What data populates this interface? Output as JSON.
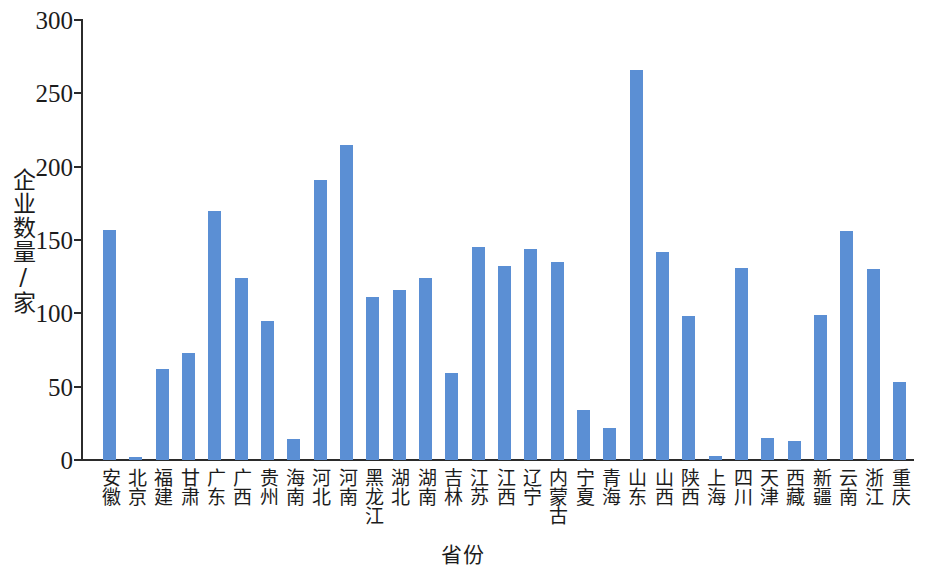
{
  "chart_data": {
    "type": "bar",
    "title": "",
    "xlabel": "省份",
    "ylabel": "企业数量/家",
    "ylim": [
      0,
      300
    ],
    "yticks": [
      0,
      50,
      100,
      150,
      200,
      250,
      300
    ],
    "grid": false,
    "legend": "none",
    "bar_color": "#5b8fd4",
    "axis_color": "#2b2b2b",
    "categories": [
      "安徽",
      "北京",
      "福建",
      "甘肃",
      "广东",
      "广西",
      "贵州",
      "海南",
      "河北",
      "河南",
      "黑龙江",
      "湖北",
      "湖南",
      "吉林",
      "江苏",
      "江西",
      "辽宁",
      "内蒙古",
      "宁夏",
      "青海",
      "山东",
      "山西",
      "陕西",
      "上海",
      "四川",
      "天津",
      "西藏",
      "新疆",
      "云南",
      "浙江",
      "重庆"
    ],
    "values": [
      157,
      2,
      62,
      73,
      170,
      124,
      95,
      14,
      191,
      215,
      111,
      116,
      124,
      59,
      145,
      132,
      144,
      135,
      34,
      22,
      266,
      142,
      98,
      3,
      131,
      15,
      13,
      99,
      156,
      130,
      53
    ]
  }
}
